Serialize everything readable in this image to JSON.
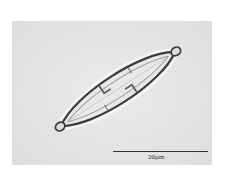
{
  "image": {
    "subject": "diatom-micrograph",
    "background_color": "#e6e6e6"
  },
  "scale_bar": {
    "label": "20µm"
  }
}
